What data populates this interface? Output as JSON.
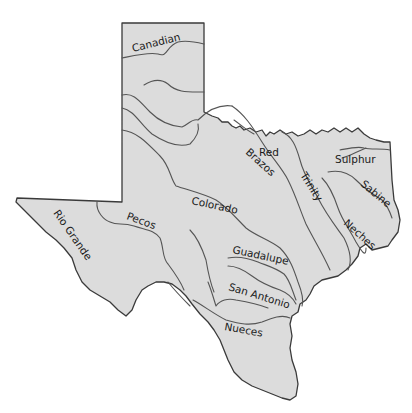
{
  "map": {
    "region": "Texas",
    "colors": {
      "land": "#dcdcdc",
      "border": "#3a3a3a",
      "river": "#555555",
      "label": "#1a1a1a",
      "background": "#ffffff"
    },
    "rivers": [
      {
        "name": "Canadian",
        "label": "Canadian"
      },
      {
        "name": "Red",
        "label": "Red"
      },
      {
        "name": "Sulphur",
        "label": "Sulphur"
      },
      {
        "name": "Brazos",
        "label": "Brazos"
      },
      {
        "name": "Trinity",
        "label": "Trinity"
      },
      {
        "name": "Sabine",
        "label": "Sabine"
      },
      {
        "name": "Neches",
        "label": "Neches"
      },
      {
        "name": "Colorado",
        "label": "Colorado"
      },
      {
        "name": "Pecos",
        "label": "Pecos"
      },
      {
        "name": "Rio Grande",
        "label": "Rio Grande"
      },
      {
        "name": "Guadalupe",
        "label": "Guadalupe"
      },
      {
        "name": "San Antonio",
        "label": "San Antonio"
      },
      {
        "name": "Nueces",
        "label": "Nueces"
      }
    ]
  }
}
